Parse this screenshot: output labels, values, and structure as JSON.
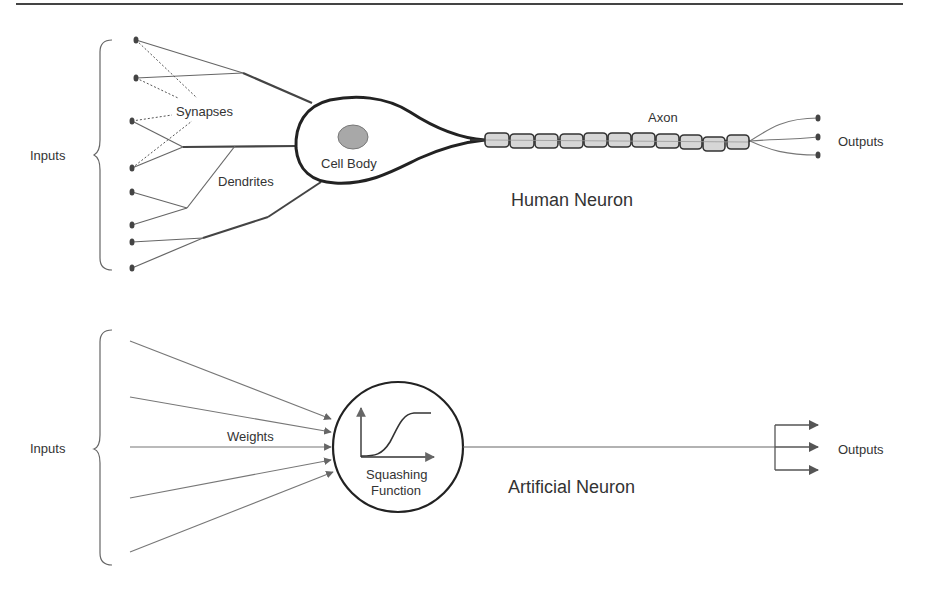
{
  "human_neuron": {
    "title": "Human Neuron",
    "inputs_label": "Inputs",
    "synapses_label": "Synapses",
    "dendrites_label": "Dendrites",
    "cell_body_label": "Cell Body",
    "axon_label": "Axon",
    "outputs_label": "Outputs",
    "input_count": 8,
    "axon_segment_count": 11,
    "output_count": 3
  },
  "artificial_neuron": {
    "title": "Artificial Neuron",
    "inputs_label": "Inputs",
    "weights_label": "Weights",
    "function_label_line1": "Squashing",
    "function_label_line2": "Function",
    "outputs_label": "Outputs",
    "input_count": 5,
    "output_count": 3
  },
  "colors": {
    "line": "#555555",
    "thick_line": "#222222",
    "nucleus": "#999999",
    "myelin": "#d4d4d4"
  }
}
